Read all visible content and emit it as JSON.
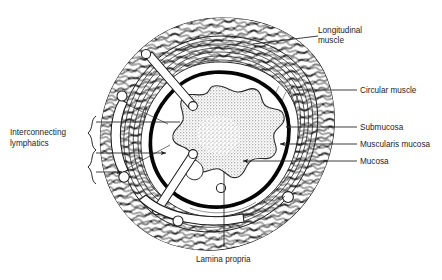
{
  "figure": {
    "background_color": "#ffffff",
    "ink_color": "#1d1d1d",
    "stipple_color": "#4a4a4a",
    "width": 442,
    "height": 280
  },
  "labels": {
    "longitudinal_muscle_line1": "Longitudinal",
    "longitudinal_muscle_line2": "muscle",
    "circular_muscle": "Circular muscle",
    "submucosa": "Submucosa",
    "muscularis_mucosa": "Muscularis mucosa",
    "mucosa": "Mucosa",
    "interconnecting_line1": "Interconnecting",
    "interconnecting_line2": "lymphatics",
    "lamina_propria": "Lamina propria"
  },
  "layers": [
    {
      "name": "Longitudinal muscle",
      "position": "outermost",
      "texture": "dash-hatched fibres"
    },
    {
      "name": "Circular muscle",
      "position": "outer-mid",
      "texture": "concentric arcs"
    },
    {
      "name": "Submucosa",
      "position": "inner-mid",
      "texture": "plain white band"
    },
    {
      "name": "Muscularis mucosa",
      "position": "inner",
      "texture": "solid black band"
    },
    {
      "name": "Mucosa",
      "position": "innermost lumen lining",
      "texture": "stippled folds"
    },
    {
      "name": "Lamina propria",
      "position": "within mucosa",
      "texture": "stippled"
    },
    {
      "name": "Interconnecting lymphatics",
      "position": "traversing wall",
      "texture": "white channels with round nodes"
    }
  ],
  "leaders": {
    "longitudinal_muscle": {
      "from": [
        318,
        36
      ],
      "to": [
        253,
        44
      ]
    },
    "circular_muscle": {
      "from": [
        358,
        90
      ],
      "to": [
        296,
        90
      ]
    },
    "submucosa": {
      "from": [
        358,
        127
      ],
      "to": [
        283,
        127
      ],
      "arrow": true
    },
    "muscularis_mucosa": {
      "from": [
        358,
        144
      ],
      "to": [
        277,
        144
      ],
      "arrow": true
    },
    "mucosa": {
      "from": [
        358,
        161
      ],
      "to": [
        240,
        161
      ],
      "arrow": true
    },
    "lamina_propria": {
      "from": [
        224,
        250
      ],
      "to": [
        224,
        170
      ]
    },
    "lymphatics_upper": {
      "from": [
        96,
        122
      ],
      "to": [
        178,
        122
      ]
    },
    "lymphatics_lower": {
      "from": [
        96,
        153
      ],
      "to": [
        163,
        153
      ],
      "arrow": true
    },
    "lymphatics_arrow": {
      "from": [
        96,
        170
      ],
      "to": [
        119,
        170
      ],
      "arrow": true
    }
  },
  "brace": {
    "x": 92,
    "top": 118,
    "bottom": 182
  },
  "icons": {
    "arrowhead": "arrowhead-icon",
    "brace": "curly-brace-icon"
  }
}
